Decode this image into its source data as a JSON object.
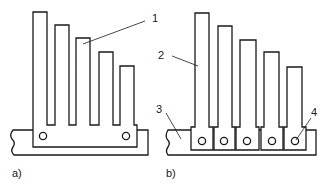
{
  "figure": {
    "panels": [
      {
        "id": "a",
        "caption": "a)",
        "callouts": [
          {
            "number": "1",
            "meaning": "fin"
          }
        ]
      },
      {
        "id": "b",
        "caption": "b)",
        "callouts": [
          {
            "number": "2",
            "meaning": "fin"
          },
          {
            "number": "3",
            "meaning": "base"
          },
          {
            "number": "4",
            "meaning": "fastener hole"
          }
        ]
      }
    ]
  },
  "labels": {
    "l1": "1",
    "l2": "2",
    "l3": "3",
    "l4": "4",
    "cap_a": "a)",
    "cap_b": "b)"
  },
  "colors": {
    "stroke": "#1a1a1a",
    "background": "#ffffff"
  }
}
